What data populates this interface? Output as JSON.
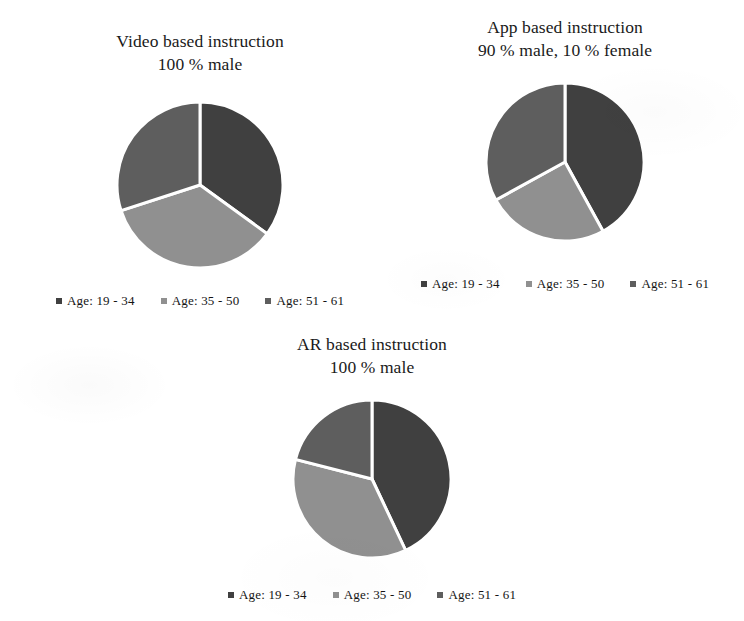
{
  "figure": {
    "background_color": "#ffffff",
    "text_color": "#1a1a1a"
  },
  "palette": {
    "age_19_34": "#404040",
    "age_35_50": "#909090",
    "age_51_61": "#5e5e5e",
    "slice_border": "#ffffff"
  },
  "legend_common": {
    "items": [
      {
        "label": "Age: 19 - 34",
        "color": "#404040",
        "marker": "square-marker"
      },
      {
        "label": "Age: 35 - 50",
        "color": "#909090",
        "marker": "square-marker"
      },
      {
        "label": "Age: 51 - 61",
        "color": "#5e5e5e",
        "marker": "square-marker"
      }
    ]
  },
  "charts": [
    {
      "id": "video",
      "title_line1": "Video based instruction",
      "title_line2": "100 % male",
      "title": "Video based instruction\n100 % male"
    },
    {
      "id": "app",
      "title_line1": "App based instruction",
      "title_line2": "90 % male, 10 % female",
      "title": "App based instruction\n90 % male, 10 % female"
    },
    {
      "id": "ar",
      "title_line1": "AR based instruction",
      "title_line2": "100 % male",
      "title": "AR based instruction\n100 % male"
    }
  ],
  "chart_data": [
    {
      "type": "pie",
      "id": "video-pie",
      "title": "Video based instruction 100 % male",
      "labels": [
        "Age: 19 - 34",
        "Age: 35 - 50",
        "Age: 51 - 61"
      ],
      "values": [
        35,
        35,
        30
      ],
      "colors": [
        "#404040",
        "#909090",
        "#5e5e5e"
      ],
      "start_angle_deg": 0,
      "direction": "clockwise",
      "legend_position": "bottom",
      "grid": false
    },
    {
      "type": "pie",
      "id": "app-pie",
      "title": "App based instruction 90 % male, 10 % female",
      "labels": [
        "Age: 19 - 34",
        "Age: 35 - 50",
        "Age: 51 - 61"
      ],
      "values": [
        42,
        25,
        33
      ],
      "colors": [
        "#404040",
        "#909090",
        "#5e5e5e"
      ],
      "start_angle_deg": 0,
      "direction": "clockwise",
      "legend_position": "bottom",
      "grid": false
    },
    {
      "type": "pie",
      "id": "ar-pie",
      "title": "AR based instruction 100 % male",
      "labels": [
        "Age: 19 - 34",
        "Age: 35 - 50",
        "Age: 51 - 61"
      ],
      "values": [
        43,
        36,
        21
      ],
      "colors": [
        "#404040",
        "#909090",
        "#5e5e5e"
      ],
      "start_angle_deg": 0,
      "direction": "clockwise",
      "legend_position": "bottom",
      "grid": false
    }
  ]
}
